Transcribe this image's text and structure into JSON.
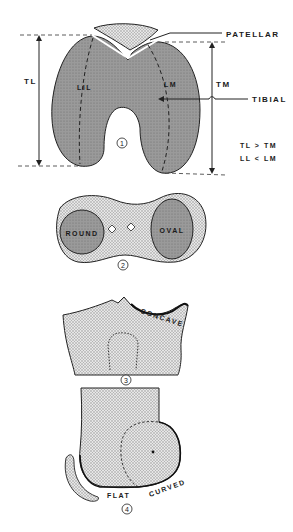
{
  "figure": {
    "panel1": {
      "number": "1",
      "labels": {
        "patellar": "PATELLAR",
        "tibial": "TIBIAL",
        "tl": "TL",
        "tm": "TM",
        "ll": "LIL",
        "lm": "LM"
      },
      "relations": [
        "TL > TM",
        "LL < LM"
      ]
    },
    "panel2": {
      "number": "2",
      "labels": {
        "left": "ROUND",
        "right": "OVAL"
      }
    },
    "panel3": {
      "number": "3",
      "labels": {
        "concave": "CONCAVE"
      }
    },
    "panel4": {
      "number": "4",
      "labels": {
        "flat": "FLAT",
        "curved": "CURVED"
      }
    },
    "colors": {
      "condyle_fill": "#8c8c8c",
      "stipple_fill": "#cfcfcf",
      "ink": "#1a1a1a"
    }
  }
}
